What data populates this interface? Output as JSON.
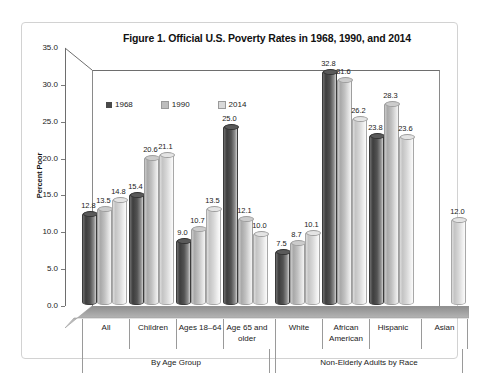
{
  "figure": {
    "title": "Figure 1. Official U.S. Poverty Rates in 1968, 1990, and 2014"
  },
  "axes": {
    "ylabel": "Percent Poor",
    "yticks": [
      "35.0",
      "30.0",
      "25.0",
      "20.0",
      "15.0",
      "10.0",
      "5.0",
      "0.0"
    ]
  },
  "legend": {
    "items": [
      {
        "label": "1968",
        "color": "#4a4a4a"
      },
      {
        "label": "1990",
        "color": "#bdbdbd"
      },
      {
        "label": "2014",
        "color": "#d9d9d9"
      }
    ]
  },
  "supergroups": [
    {
      "label": "By Age Group"
    },
    {
      "label": "Non-Elderly Adults by Race"
    }
  ],
  "chart_data": {
    "type": "bar",
    "title": "Figure 1. Official U.S. Poverty Rates in 1968, 1990, and 2014",
    "xlabel": "",
    "ylabel": "Percent Poor",
    "ylim": [
      0.0,
      35.0
    ],
    "ytick_step": 5.0,
    "grid": false,
    "legend_position": "inside-top-left",
    "style_note": "3-D clustered cylinder chart with data labels above each cylinder",
    "categories": [
      "All",
      "Children",
      "Ages 18–64",
      "Age 65 and older",
      "White",
      "African American",
      "Hispanic",
      "Asian"
    ],
    "category_groups": [
      {
        "label": "By Age Group",
        "categories": [
          "All",
          "Children",
          "Ages 18–64",
          "Age 65 and older"
        ]
      },
      {
        "label": "Non-Elderly Adults by Race",
        "categories": [
          "White",
          "African American",
          "Hispanic",
          "Asian"
        ]
      }
    ],
    "series": [
      {
        "name": "1968",
        "color": "#4a4a4a",
        "values": [
          12.8,
          15.4,
          9.0,
          25.0,
          7.5,
          32.8,
          23.8,
          null
        ]
      },
      {
        "name": "1990",
        "color": "#bdbdbd",
        "values": [
          13.5,
          20.6,
          10.7,
          12.1,
          8.7,
          31.6,
          28.3,
          null
        ]
      },
      {
        "name": "2014",
        "color": "#d9d9d9",
        "values": [
          14.8,
          21.1,
          13.5,
          10.0,
          10.1,
          26.2,
          23.6,
          12.0
        ]
      }
    ],
    "data_labels": [
      [
        "12.8",
        "13.5",
        "14.8"
      ],
      [
        "15.4",
        "20.6",
        "21.1"
      ],
      [
        "9.0",
        "10.7",
        "13.5"
      ],
      [
        "25.0",
        "12.1",
        "10.0"
      ],
      [
        "7.5",
        "8.7",
        "10.1"
      ],
      [
        "32.8",
        "31.6",
        "26.2"
      ],
      [
        "23.8",
        "28.3",
        "23.6"
      ],
      [
        null,
        null,
        "12.0"
      ]
    ]
  }
}
